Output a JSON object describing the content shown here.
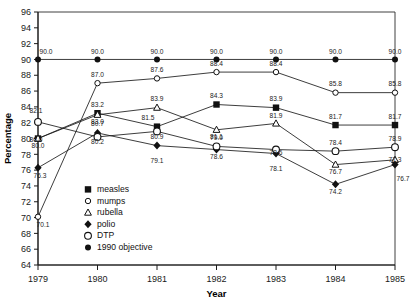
{
  "chart_data": {
    "type": "line",
    "title": "",
    "xlabel": "Year",
    "ylabel": "Percentage",
    "categories": [
      "1979",
      "1980",
      "1981",
      "1982",
      "1983",
      "1984",
      "1985"
    ],
    "x": [
      1979,
      1980,
      1981,
      1982,
      1983,
      1984,
      1985
    ],
    "ylim": [
      64,
      96
    ],
    "yticks": [
      64,
      66,
      68,
      70,
      72,
      74,
      76,
      78,
      80,
      82,
      84,
      86,
      88,
      90,
      92,
      94,
      96
    ],
    "grid": false,
    "legend_position": "inside-lower-left",
    "series": [
      {
        "name": "measles",
        "marker": "filled-square",
        "values": [
          80.0,
          83.2,
          81.5,
          84.3,
          83.9,
          81.7,
          81.7
        ],
        "labels": [
          "80.0",
          "83.2",
          "81.5",
          "84.3",
          "83.9",
          "81.7",
          "81.7"
        ]
      },
      {
        "name": "mumps",
        "marker": "open-circle-small",
        "values": [
          null,
          87.0,
          87.6,
          88.4,
          88.4,
          85.8,
          85.8
        ],
        "labels": [
          "",
          "87.0",
          "87.6",
          "88.4",
          "88.4",
          "85.8",
          "85.8"
        ]
      },
      {
        "name": "rubella",
        "marker": "open-triangle",
        "values": [
          80.0,
          83.0,
          83.9,
          81.1,
          81.9,
          76.7,
          77.3
        ],
        "labels": [
          "80.0",
          "83.0",
          "83.9",
          "81.1",
          "81.9",
          "76.7",
          "77.3"
        ]
      },
      {
        "name": "polio",
        "marker": "filled-diamond",
        "values": [
          76.3,
          80.7,
          79.1,
          78.6,
          78.1,
          74.2,
          76.7
        ],
        "labels": [
          "76.3",
          "80.7",
          "79.1",
          "78.6",
          "78.1",
          "74.2",
          "76.7"
        ]
      },
      {
        "name": "DTP",
        "marker": "open-circle-large",
        "values": [
          82.1,
          80.2,
          80.9,
          79.0,
          78.6,
          78.4,
          78.9
        ],
        "labels": [
          "82.1",
          "80.2",
          "80.9",
          "79.0",
          "78.6",
          "78.4",
          "78.9"
        ]
      },
      {
        "name": "1990 objective",
        "marker": "filled-circle-small",
        "values": [
          90.0,
          90.0,
          90.0,
          90.0,
          90.0,
          90.0,
          90.0
        ],
        "labels": [
          "90.0",
          "90.0",
          "90.0",
          "90.0",
          "90.0",
          "90.0",
          "90.0"
        ]
      }
    ],
    "extra_points": [
      {
        "series": "mumps",
        "x": 1979,
        "value": 70.1,
        "label": "70.1",
        "connects_to": 1980
      }
    ]
  },
  "legend": {
    "items": [
      {
        "label": "measles",
        "marker": "filled-square"
      },
      {
        "label": "mumps",
        "marker": "open-circle-small"
      },
      {
        "label": "rubella",
        "marker": "open-triangle"
      },
      {
        "label": "polio",
        "marker": "filled-diamond"
      },
      {
        "label": "DTP",
        "marker": "open-circle-large"
      },
      {
        "label": "1990 objective",
        "marker": "filled-circle-small"
      }
    ]
  },
  "axes": {
    "y_title": "Percentage",
    "x_title": "Year",
    "y_tick_labels": [
      "96",
      "94",
      "92",
      "90",
      "88",
      "86",
      "84",
      "82",
      "80",
      "78",
      "76",
      "74",
      "72",
      "70",
      "68",
      "66",
      "64"
    ],
    "x_tick_labels": [
      "1979",
      "1980",
      "1981",
      "1982",
      "1983",
      "1984",
      "1985"
    ]
  }
}
